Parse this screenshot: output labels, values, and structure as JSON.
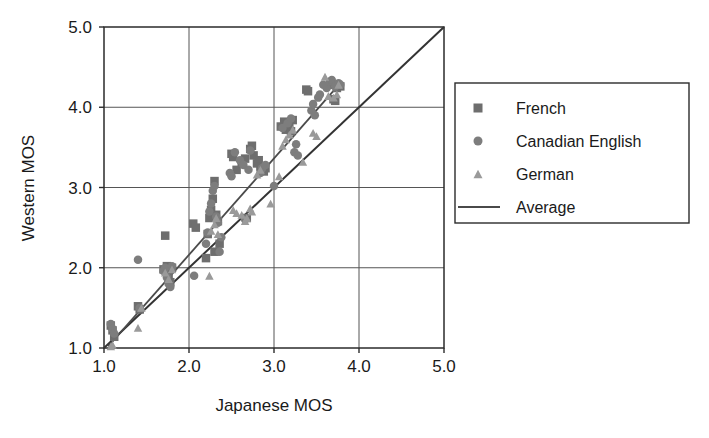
{
  "chart_data": {
    "type": "scatter",
    "title": "",
    "xlabel": "Japanese MOS",
    "ylabel": "Western MOS",
    "xlim": [
      1.0,
      5.0
    ],
    "ylim": [
      1.0,
      5.0
    ],
    "xticks": [
      "1.0",
      "2.0",
      "3.0",
      "4.0",
      "5.0"
    ],
    "yticks": [
      "1.0",
      "2.0",
      "3.0",
      "4.0",
      "5.0"
    ],
    "xtick_values": [
      1.0,
      2.0,
      3.0,
      4.0,
      5.0
    ],
    "ytick_values": [
      1.0,
      2.0,
      3.0,
      4.0,
      5.0
    ],
    "grid": true,
    "legend_position": "right",
    "series": [
      {
        "name": "French",
        "marker": "square",
        "color": "#6e6e6e",
        "points": [
          [
            1.08,
            1.28
          ],
          [
            1.1,
            1.22
          ],
          [
            1.12,
            1.14
          ],
          [
            1.4,
            1.52
          ],
          [
            1.42,
            1.48
          ],
          [
            1.72,
            2.4
          ],
          [
            1.7,
            1.98
          ],
          [
            1.74,
            2.02
          ],
          [
            1.76,
            1.92
          ],
          [
            1.78,
            1.82
          ],
          [
            1.8,
            2.0
          ],
          [
            2.05,
            2.55
          ],
          [
            2.08,
            2.5
          ],
          [
            2.2,
            2.12
          ],
          [
            2.24,
            2.62
          ],
          [
            2.26,
            2.72
          ],
          [
            2.22,
            2.42
          ],
          [
            2.28,
            2.86
          ],
          [
            2.3,
            3.08
          ],
          [
            2.32,
            2.66
          ],
          [
            2.34,
            2.58
          ],
          [
            2.36,
            2.3
          ],
          [
            2.3,
            2.2
          ],
          [
            2.5,
            3.42
          ],
          [
            2.52,
            3.38
          ],
          [
            2.56,
            3.22
          ],
          [
            2.62,
            3.3
          ],
          [
            2.66,
            3.36
          ],
          [
            2.68,
            2.62
          ],
          [
            2.72,
            3.48
          ],
          [
            2.74,
            3.52
          ],
          [
            2.76,
            3.4
          ],
          [
            2.8,
            3.3
          ],
          [
            2.82,
            3.34
          ],
          [
            2.84,
            3.26
          ],
          [
            2.88,
            3.2
          ],
          [
            2.9,
            3.24
          ],
          [
            3.08,
            3.76
          ],
          [
            3.12,
            3.82
          ],
          [
            3.14,
            3.72
          ],
          [
            3.18,
            3.78
          ],
          [
            3.2,
            3.7
          ],
          [
            3.22,
            3.84
          ],
          [
            3.38,
            4.22
          ],
          [
            3.4,
            4.2
          ],
          [
            3.66,
            4.28
          ],
          [
            3.7,
            4.1
          ],
          [
            3.72,
            4.08
          ],
          [
            3.74,
            4.24
          ],
          [
            3.78,
            4.26
          ]
        ]
      },
      {
        "name": "Canadian English",
        "marker": "circle",
        "color": "#7d7d7d",
        "points": [
          [
            1.08,
            1.3
          ],
          [
            1.1,
            1.24
          ],
          [
            1.12,
            1.18
          ],
          [
            1.4,
            2.1
          ],
          [
            1.42,
            1.5
          ],
          [
            1.7,
            1.96
          ],
          [
            1.72,
            2.0
          ],
          [
            1.74,
            1.88
          ],
          [
            1.76,
            1.8
          ],
          [
            1.78,
            1.76
          ],
          [
            1.8,
            2.02
          ],
          [
            2.06,
            1.9
          ],
          [
            2.2,
            2.3
          ],
          [
            2.22,
            2.44
          ],
          [
            2.24,
            2.7
          ],
          [
            2.26,
            2.8
          ],
          [
            2.28,
            2.96
          ],
          [
            2.3,
            3.02
          ],
          [
            2.32,
            2.64
          ],
          [
            2.34,
            2.56
          ],
          [
            2.36,
            2.2
          ],
          [
            2.38,
            2.38
          ],
          [
            2.48,
            3.18
          ],
          [
            2.5,
            3.14
          ],
          [
            2.54,
            3.44
          ],
          [
            2.6,
            3.34
          ],
          [
            2.64,
            3.28
          ],
          [
            2.66,
            2.6
          ],
          [
            2.7,
            3.22
          ],
          [
            2.72,
            3.46
          ],
          [
            2.84,
            3.18
          ],
          [
            2.86,
            3.24
          ],
          [
            2.9,
            3.28
          ],
          [
            3.0,
            3.02
          ],
          [
            3.1,
            3.74
          ],
          [
            3.16,
            3.8
          ],
          [
            3.2,
            3.86
          ],
          [
            3.24,
            3.44
          ],
          [
            3.26,
            3.54
          ],
          [
            3.28,
            3.4
          ],
          [
            3.44,
            3.96
          ],
          [
            3.46,
            4.04
          ],
          [
            3.48,
            3.9
          ],
          [
            3.52,
            4.12
          ],
          [
            3.54,
            4.16
          ],
          [
            3.58,
            4.28
          ],
          [
            3.62,
            4.24
          ],
          [
            3.66,
            4.32
          ],
          [
            3.68,
            4.34
          ],
          [
            3.72,
            4.26
          ],
          [
            3.76,
            4.3
          ],
          [
            3.78,
            4.28
          ]
        ]
      },
      {
        "name": "German",
        "marker": "triangle",
        "color": "#9a9a9a",
        "points": [
          [
            1.08,
            1.02
          ],
          [
            1.1,
            1.04
          ],
          [
            1.4,
            1.25
          ],
          [
            1.44,
            1.5
          ],
          [
            1.72,
            1.94
          ],
          [
            1.76,
            1.86
          ],
          [
            1.8,
            1.98
          ],
          [
            2.24,
            1.9
          ],
          [
            2.26,
            2.46
          ],
          [
            2.3,
            2.54
          ],
          [
            2.32,
            2.62
          ],
          [
            2.34,
            2.42
          ],
          [
            2.52,
            2.72
          ],
          [
            2.56,
            2.68
          ],
          [
            2.62,
            2.66
          ],
          [
            2.66,
            2.58
          ],
          [
            2.68,
            2.62
          ],
          [
            2.72,
            2.74
          ],
          [
            2.74,
            2.7
          ],
          [
            2.8,
            3.16
          ],
          [
            2.84,
            3.22
          ],
          [
            2.96,
            2.8
          ],
          [
            3.06,
            3.14
          ],
          [
            3.1,
            3.52
          ],
          [
            3.14,
            3.6
          ],
          [
            3.18,
            3.66
          ],
          [
            3.22,
            3.72
          ],
          [
            3.34,
            3.32
          ],
          [
            3.46,
            3.68
          ],
          [
            3.5,
            3.64
          ],
          [
            3.6,
            4.38
          ],
          [
            3.64,
            4.14
          ],
          [
            3.7,
            4.12
          ],
          [
            3.74,
            4.16
          ],
          [
            3.76,
            4.28
          ]
        ]
      }
    ],
    "lines": [
      {
        "name": "identity",
        "style": "solid",
        "color": "#333333",
        "from": [
          1.0,
          1.0
        ],
        "to": [
          5.0,
          5.0
        ]
      },
      {
        "name": "Average",
        "style": "solid",
        "color": "#4a4a4a",
        "from": [
          1.05,
          1.02
        ],
        "to": [
          3.78,
          4.3
        ]
      }
    ]
  },
  "legend": {
    "items": [
      {
        "label": "French",
        "marker": "square",
        "color": "#6e6e6e"
      },
      {
        "label": "Canadian English",
        "marker": "circle",
        "color": "#7d7d7d"
      },
      {
        "label": "German",
        "marker": "triangle",
        "color": "#9a9a9a"
      },
      {
        "label": "Average",
        "marker": "line",
        "color": "#4a4a4a"
      }
    ]
  },
  "axes": {
    "x_title": "Japanese MOS",
    "y_title": "Western MOS",
    "x_tick_labels": [
      "1.0",
      "2.0",
      "3.0",
      "4.0",
      "5.0"
    ],
    "y_tick_labels": [
      "1.0",
      "2.0",
      "3.0",
      "4.0",
      "5.0"
    ]
  },
  "style": {
    "background": "#ffffff",
    "axis_color": "#2b2b2b",
    "grid_color": "#555555"
  }
}
